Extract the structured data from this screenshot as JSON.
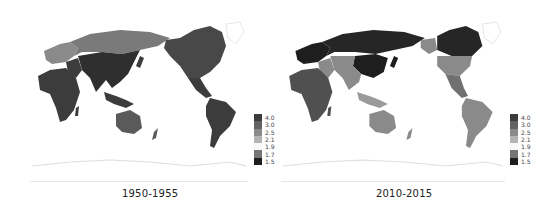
{
  "legend": {
    "breaks": [
      "4.0",
      "3.0",
      "2.5",
      "2.1",
      "1.9",
      "1.7",
      "1.5"
    ],
    "colors": [
      "#3c3c3c",
      "#636363",
      "#8a8a8a",
      "#b4b4b4",
      "#f8f8f8",
      "#767676",
      "#1e1e1e"
    ]
  },
  "maps": [
    {
      "caption": "1950-1955",
      "regions": {
        "africa": "#3c3c3c",
        "russia": "#7a7a7a",
        "europe": "#8a8a8a",
        "asia_central_south": "#2f2f2f",
        "middle_east": "#3c3c3c",
        "southeast_asia": "#3c3c3c",
        "australia": "#5a5a5a",
        "north_america": "#484848",
        "central_america": "#3c3c3c",
        "south_america": "#3c3c3c",
        "greenland": "#ffffff",
        "antarctica": "#ffffff"
      }
    },
    {
      "caption": "2010-2015",
      "regions": {
        "africa": "#505050",
        "russia": "#262626",
        "europe": "#1e1e1e",
        "asia_central_south": "#8a8a8a",
        "middle_east": "#8a8a8a",
        "southeast_asia": "#9a9a9a",
        "australia": "#8a8a8a",
        "north_america": "#8a8a8a",
        "central_america": "#707070",
        "south_america": "#8a8a8a",
        "greenland": "#ffffff",
        "antarctica": "#ffffff",
        "canada": "#262626",
        "alaska": "#8a8a8a",
        "china": "#1e1e1e"
      }
    }
  ]
}
